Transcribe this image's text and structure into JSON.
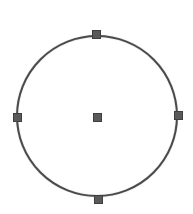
{
  "shape": {
    "type": "circle",
    "center": {
      "x": 97,
      "y": 116
    },
    "radius": 81,
    "stroke_color": "#4a4a4a",
    "stroke_width": 2.5,
    "fill": "transparent",
    "selected": true
  },
  "handles": {
    "size": 9,
    "color": "#5a5a5a",
    "border_color": "#3f3f3f",
    "items": [
      {
        "id": "top",
        "x": 96,
        "y": 34
      },
      {
        "id": "right",
        "x": 178,
        "y": 115
      },
      {
        "id": "bottom",
        "x": 98,
        "y": 199
      },
      {
        "id": "left",
        "x": 17,
        "y": 117
      },
      {
        "id": "center",
        "x": 97,
        "y": 117
      }
    ]
  },
  "colors": {
    "background": "#ffffff"
  }
}
